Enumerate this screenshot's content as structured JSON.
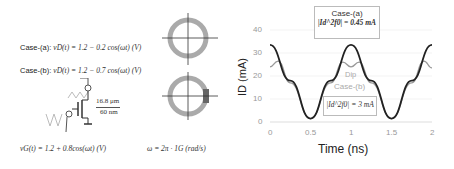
{
  "left_panel": {
    "case_a_label": "Case-(a):",
    "case_a_eq": "vD(t) = 1.2 − 0.2 cos(ωt) (V)",
    "case_b_label": "Case-(b):",
    "case_b_eq": "vD(t) = 1.2 − 0.7 cos(ωt) (V)",
    "transistor_w": "16.8 μm",
    "transistor_l": "60 nm",
    "gate_eq": "vG(t) = 1.2 + 0.8cos(ωt) (V)",
    "omega_eq": "ω = 2π · 1G (rad/s)"
  },
  "chart_data": {
    "type": "line",
    "title": "",
    "xlabel": "Time (ns)",
    "ylabel": "ID (mA)",
    "xlim": [
      0,
      2
    ],
    "ylim": [
      0,
      40
    ],
    "xticks": [
      "0",
      "0.5",
      "1",
      "1.5",
      "2"
    ],
    "yticks": [
      "0",
      "10",
      "20",
      "30",
      "40"
    ],
    "grid": true,
    "series": [
      {
        "name": "Case-(a)",
        "color": "#222222",
        "x": [
          0,
          0.25,
          0.5,
          0.75,
          1.0,
          1.25,
          1.5,
          1.75,
          2.0
        ],
        "values": [
          33.5,
          18,
          1.5,
          18,
          33.5,
          18,
          1.5,
          18,
          33.5
        ]
      },
      {
        "name": "Case-(b)",
        "color": "#999999",
        "x": [
          0,
          0.1,
          0.25,
          0.5,
          0.75,
          0.9,
          1.0,
          1.1,
          1.25,
          1.5,
          1.75,
          1.9,
          2.0
        ],
        "values": [
          24,
          26.5,
          17,
          1.5,
          17,
          26,
          24,
          26,
          17,
          1.5,
          17,
          26.5,
          23.5
        ]
      }
    ],
    "annotations": [
      {
        "text": "Case-(a)",
        "sub": "|Id^2f0| = 0.45 mA"
      },
      {
        "text": "Dip"
      },
      {
        "text": "Case-(b)",
        "sub": "|Id^2f0| = 3 mA"
      }
    ]
  }
}
